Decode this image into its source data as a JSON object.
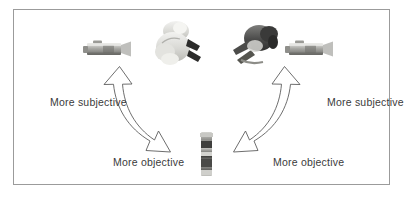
{
  "figure": {
    "border_color": "#9b9b9b",
    "background_color": "#ffffff",
    "text_color": "#3b3b3b"
  },
  "labels": {
    "subjective_left": "More subjective",
    "subjective_right": "More subjective",
    "objective_left": "More objective",
    "objective_right": "More objective"
  },
  "nodes": [
    {
      "id": "camcorder-left",
      "icon": "camcorder-icon",
      "tone": "grayscale-light"
    },
    {
      "id": "camcorder-right",
      "icon": "camcorder-icon",
      "tone": "grayscale-light"
    },
    {
      "id": "figure-light",
      "icon": "person-figure-icon",
      "tone": "grayscale-light"
    },
    {
      "id": "figure-dark",
      "icon": "person-figure-icon",
      "tone": "grayscale-dark"
    },
    {
      "id": "object-center",
      "icon": "upright-object-icon",
      "tone": "grayscale-mixed"
    }
  ],
  "arrows": [
    {
      "id": "arrow-left",
      "from_label": "objective_left",
      "to_label": "subjective_left",
      "style": "curved-double-headed-outline",
      "stroke": "#5a5a5a"
    },
    {
      "id": "arrow-right",
      "from_label": "objective_right",
      "to_label": "subjective_right",
      "style": "curved-double-headed-outline",
      "stroke": "#5a5a5a"
    }
  ]
}
